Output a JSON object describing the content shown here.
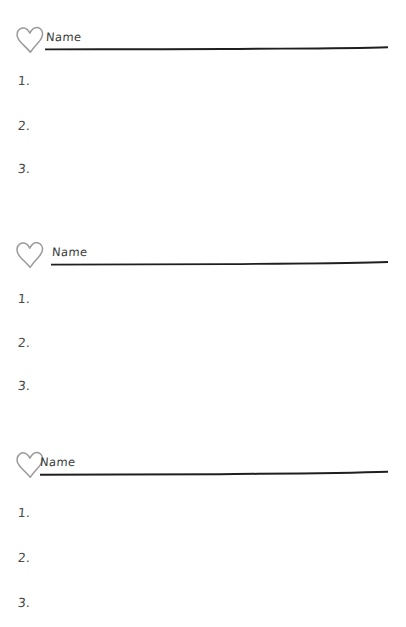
{
  "page": {
    "background_color": "#ffffff",
    "width": 406,
    "height": 627
  },
  "style": {
    "heart_stroke_color": "#9a9a9a",
    "rule_color": "#1f1f1f",
    "name_text_color": "#3a3a3a",
    "number_text_color": "#4a4a4a"
  },
  "sections": [
    {
      "heart_icon": "heart-icon",
      "name_label": "Name",
      "name_rule": "ruled-line",
      "items": [
        {
          "number": "1."
        },
        {
          "number": "2."
        },
        {
          "number": "3."
        }
      ]
    },
    {
      "heart_icon": "heart-icon",
      "name_label": "Name",
      "name_rule": "ruled-line",
      "items": [
        {
          "number": "1."
        },
        {
          "number": "2."
        },
        {
          "number": "3."
        }
      ]
    },
    {
      "heart_icon": "heart-icon",
      "name_label": "Name",
      "name_rule": "ruled-line",
      "items": [
        {
          "number": "1."
        },
        {
          "number": "2."
        },
        {
          "number": "3."
        }
      ]
    }
  ]
}
